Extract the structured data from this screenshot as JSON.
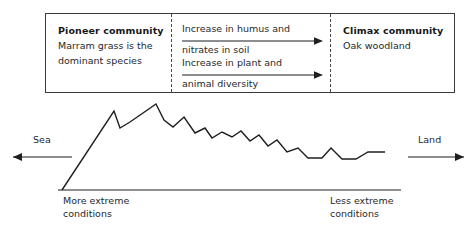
{
  "diagram": {
    "succession": {
      "pioneer": {
        "title": "Pioneer community",
        "line1": "Marram grass is the",
        "line2": "dominant species"
      },
      "middle": {
        "changes": [
          {
            "line1": "Increase in humus and",
            "line2": "nitrates in soil",
            "arrow": "right-arrow-icon"
          },
          {
            "line1": "Increase in plant and",
            "line2": "animal diversity",
            "arrow": "right-arrow-icon"
          }
        ]
      },
      "climax": {
        "title": "Climax community",
        "line1": "Oak woodland",
        "line2": ""
      }
    },
    "profile": {
      "sea_label": "Sea",
      "land_label": "Land",
      "sea_arrow": "left-arrow-icon",
      "land_arrow": "right-arrow-icon",
      "left_caption_line1": "More extreme",
      "left_caption_line2": "conditions",
      "right_caption_line1": "Less extreme",
      "right_caption_line2": "conditions"
    }
  },
  "chart_data": {
    "type": "line",
    "xlabel": "Distance inland",
    "ylabel": "Dune height",
    "grid": false,
    "legend": null,
    "xlim": [
      0,
      476
    ],
    "ylim": [
      0,
      232
    ],
    "annotations": [
      "Sea",
      "Land",
      "More extreme conditions",
      "Less extreme conditions"
    ],
    "axis_baseline": {
      "x1": 58,
      "y1": 190,
      "x2": 401,
      "y2": 190
    },
    "series": [
      {
        "name": "Dune profile",
        "color": "#1d1f21",
        "points": [
          [
            62,
            190
          ],
          [
            114,
            111
          ],
          [
            120,
            128
          ],
          [
            130,
            122
          ],
          [
            143,
            113
          ],
          [
            156,
            104
          ],
          [
            164,
            120
          ],
          [
            173,
            127
          ],
          [
            184,
            117
          ],
          [
            195,
            133
          ],
          [
            205,
            128
          ],
          [
            212,
            138
          ],
          [
            222,
            132
          ],
          [
            232,
            137
          ],
          [
            241,
            131
          ],
          [
            250,
            141
          ],
          [
            259,
            135
          ],
          [
            268,
            146
          ],
          [
            277,
            140
          ],
          [
            287,
            152
          ],
          [
            298,
            148
          ],
          [
            308,
            158
          ],
          [
            322,
            158
          ],
          [
            331,
            148
          ],
          [
            342,
            159
          ],
          [
            356,
            159
          ],
          [
            368,
            152
          ],
          [
            385,
            152
          ]
        ]
      }
    ],
    "direction_arrows": [
      {
        "name": "sea-arrow",
        "x1": 72,
        "y1": 157,
        "x2": 13,
        "y2": 157,
        "direction": "left"
      },
      {
        "name": "land-arrow",
        "x1": 408,
        "y1": 157,
        "x2": 464,
        "y2": 157,
        "direction": "right"
      }
    ]
  }
}
